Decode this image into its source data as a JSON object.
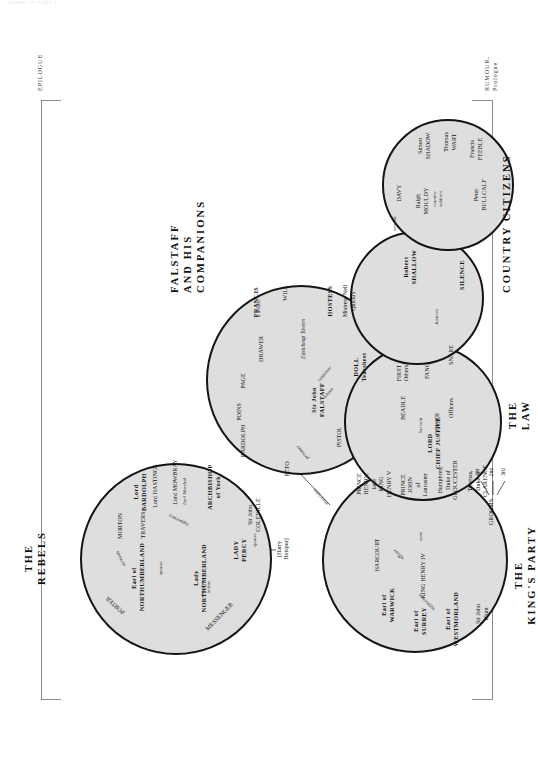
{
  "page": {
    "running_head": "HENRY IV PART 2",
    "top_caption": "EPILOGUE",
    "bottom_caption": "RUMOUR,\nPrologue"
  },
  "groups": [
    {
      "id": "rebels",
      "title": "THE\nREBELS"
    },
    {
      "id": "falstaff",
      "title": "FALSTAFF\nAND HIS\nCOMPANIONS"
    },
    {
      "id": "kings_party",
      "title": "THE\nKING'S PARTY"
    },
    {
      "id": "law",
      "title": "THE\nLAW"
    },
    {
      "id": "country",
      "title": "COUNTRY CITIZENS"
    }
  ],
  "rebels": {
    "porter": "PORTER",
    "messenger": "MESSENGER",
    "northumberland": "Earl of\nNORTHUMBERLAND",
    "lady_northumberland": "Lady\nNORTHUMBERLAND",
    "lady_percy": "LADY\nPERCY",
    "hotspur": "[Harry\nHotspur]",
    "morton": "MORTON",
    "travers": "TRAVERS",
    "bardolph": "Lord\nBARDOLPH",
    "hastings": "Lord HASTINGS",
    "mowbray": "Lord MOWBRAY",
    "mowbray_sub": "Earl Marshal",
    "archbishop": "ARCHBISHOP\nof York",
    "coleville": "Sir John\nCOLEVILLE",
    "rel_spouse1": "spouse",
    "rel_spouse2": "spouse",
    "rel_daughter": "daughter-\nin-law",
    "rel_servants": "servants",
    "rel_supporters": "supporters"
  },
  "falstaff": {
    "falstaff": "Sir John\nFALSTAFF",
    "peto": "PETO",
    "bardolph": "BARDOLPH",
    "poins": "POINS",
    "page": "PAGE",
    "pistol": "PISTOL",
    "doll": "DOLL\nTearsheet",
    "tavern": "Eastcheap Tavern",
    "drawer": "DRAWER",
    "francis": "FRANCIS",
    "francis_sub": "a drawer",
    "will": "WILL",
    "hostess": "HOSTESS",
    "hostess_sub": "Mistress Nell\nQuickly",
    "rel_prisoner": "prisoner",
    "rel_whore": "whore",
    "rel_customer": "customer",
    "rel_associates": "associates"
  },
  "kings_party": {
    "king": "KING HENRY IV",
    "surrey": "Earl of\nSURREY",
    "westmorland": "Earl of\nWESTMORLAND",
    "warwick": "Earl of\nWARWICK",
    "harcourt": "HARCOURT",
    "blunt": "Sir John\nBlunt",
    "prince_henry": "PRINCE\nHENRY,\nlater\nKING\nHENRY V",
    "prince_john": "PRINCE\nJOHN\nof\nLancaster",
    "gloucester": "Humphrey,\nDuke of\nGLOUCESTER",
    "clarence": "Thomas,\nDuke of\nCLARENCE",
    "grooms": "GROOMS",
    "groom1": "1st",
    "groom2": "2nd",
    "groom3": "3rd",
    "rel_officer": "officer",
    "rel_supporters": "supporters",
    "rel_sons": "sons"
  },
  "law": {
    "lord_chief_justice": "LORD\nCHIEF JUSTICE",
    "gower": "GOWER",
    "servant": "Servant",
    "beadle": "BEADLE",
    "first_others": "FIRST\nOthers",
    "fang": "FANG",
    "snare": "SNARE",
    "officers": "Officers"
  },
  "country": {
    "shallow": "Robert\nSHALLOW",
    "silence": "SILENCE",
    "davy": "DAVY",
    "rel_justices": "Justices",
    "rel_servant": "servant",
    "mouldy": "Ralph\nMOULDY",
    "bullcalf": "Peter\nBULLCALF",
    "feeble": "Francis\nFEEBLE",
    "wart": "Thomas\nWART",
    "shadow": "Simon\nSHADOW",
    "rel_soldiers": "country\nsoldiers"
  },
  "colors": {
    "circle_fill": "#dedede",
    "circle_stroke": "#141414",
    "text": "#111111",
    "rule": "#8d8d8d"
  }
}
